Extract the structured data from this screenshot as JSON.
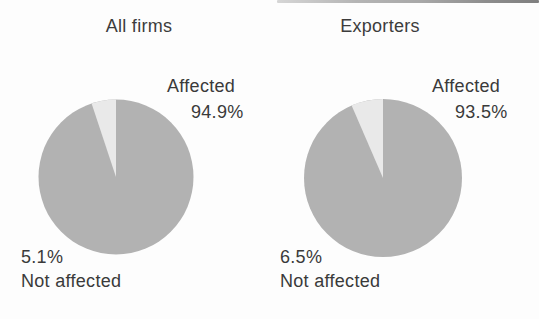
{
  "colors": {
    "affected_slice": "#b2b2b2",
    "not_affected_slice": "#e9e9e9",
    "text": "#3a3a3a",
    "background": "#fdfdfd"
  },
  "chart_data": [
    {
      "type": "pie",
      "title": "All firms",
      "legend_position": "none",
      "slices": [
        {
          "label": "Affected",
          "value": 94.9,
          "display": "94.9%",
          "color": "#b2b2b2"
        },
        {
          "label": "Not affected",
          "value": 5.1,
          "display": "5.1%",
          "color": "#e9e9e9"
        }
      ],
      "start_angle_deg_from_12_oclock": 0,
      "labels": {
        "affected_label": "Affected",
        "affected_value": "94.9%",
        "not_affected_value": "5.1%",
        "not_affected_label": "Not affected"
      }
    },
    {
      "type": "pie",
      "title": "Exporters",
      "legend_position": "none",
      "slices": [
        {
          "label": "Affected",
          "value": 93.5,
          "display": "93.5%",
          "color": "#b2b2b2"
        },
        {
          "label": "Not affected",
          "value": 6.5,
          "display": "6.5%",
          "color": "#e9e9e9"
        }
      ],
      "start_angle_deg_from_12_oclock": 0,
      "labels": {
        "affected_label": "Affected",
        "affected_value": "93.5%",
        "not_affected_value": "6.5%",
        "not_affected_label": "Not affected"
      }
    }
  ]
}
